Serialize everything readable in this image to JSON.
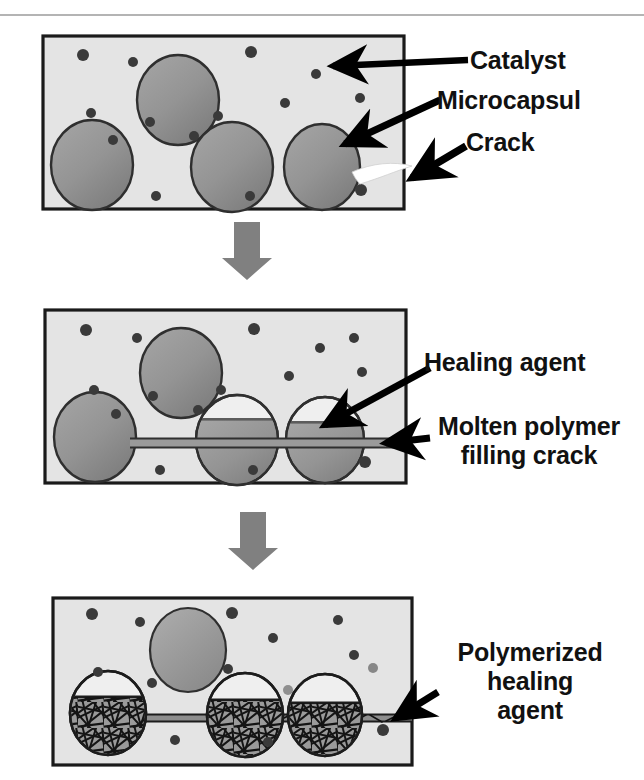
{
  "figure": {
    "colors": {
      "matrix_fill": "#e4e4e4",
      "matrix_border": "#1a1a1a",
      "capsule_fill": "#8f8f8f",
      "capsule_fill_light": "#9c9c9c",
      "capsule_border": "#2a2a2a",
      "catalyst_particle": "#3a3a3a",
      "arrow_gray": "#808080",
      "crack_white": "#ffffff",
      "label_text": "#111111",
      "pointer_black": "#000000",
      "rule_gray": "#b4b4b4",
      "polymer_network": "#161616"
    },
    "stage_arrows": [
      {
        "name": "stage-arrow-1-to-2",
        "x": 228,
        "y": 222,
        "width": 38,
        "height": 58
      },
      {
        "name": "stage-arrow-2-to-3",
        "x": 234,
        "y": 512,
        "width": 38,
        "height": 58
      }
    ]
  },
  "panels": [
    {
      "id": "panel-1",
      "stage_number": 1,
      "stage_name": "crack-formation",
      "frame": {
        "x": 43,
        "y": 36,
        "width": 361,
        "height": 173
      },
      "capsules": [
        {
          "cx": 178,
          "cy": 100,
          "rx": 41,
          "ry": 45
        },
        {
          "cx": 92,
          "cy": 165,
          "rx": 41,
          "ry": 45
        },
        {
          "cx": 232,
          "cy": 167,
          "rx": 41,
          "ry": 45
        },
        {
          "cx": 322,
          "cy": 167,
          "rx": 38,
          "ry": 43
        }
      ],
      "catalyst_particles": [
        {
          "cx": 83,
          "cy": 55,
          "r": 6
        },
        {
          "cx": 133,
          "cy": 62,
          "r": 5
        },
        {
          "cx": 251,
          "cy": 52,
          "r": 6
        },
        {
          "cx": 316,
          "cy": 74,
          "r": 5
        },
        {
          "cx": 351,
          "cy": 64,
          "r": 5
        },
        {
          "cx": 285,
          "cy": 103,
          "r": 5
        },
        {
          "cx": 360,
          "cy": 98,
          "r": 5
        },
        {
          "cx": 91,
          "cy": 113,
          "r": 5
        },
        {
          "cx": 150,
          "cy": 122,
          "r": 5
        },
        {
          "cx": 218,
          "cy": 116,
          "r": 5
        },
        {
          "cx": 194,
          "cy": 136,
          "r": 5
        },
        {
          "cx": 113,
          "cy": 140,
          "r": 5
        },
        {
          "cx": 156,
          "cy": 196,
          "r": 5
        },
        {
          "cx": 250,
          "cy": 196,
          "r": 5
        },
        {
          "cx": 361,
          "cy": 190,
          "r": 6
        }
      ],
      "labels": [
        {
          "name": "label-catalyst",
          "text": "Catalyst",
          "x": 470,
          "y": 46,
          "lines": [
            "Catalyst"
          ]
        },
        {
          "name": "label-microcapsul",
          "text": "Microcapsul",
          "x": 437,
          "y": 86,
          "lines": [
            "Microcapsul"
          ]
        },
        {
          "name": "label-crack",
          "text": "Crack",
          "x": 466,
          "y": 128,
          "lines": [
            "Crack"
          ]
        }
      ]
    },
    {
      "id": "panel-2",
      "stage_number": 2,
      "stage_name": "healing-agent-released",
      "frame": {
        "x": 45,
        "y": 310,
        "width": 361,
        "height": 173
      },
      "capsules": [
        {
          "cx": 181,
          "cy": 373,
          "rx": 41,
          "ry": 45,
          "drained": false
        },
        {
          "cx": 95,
          "cy": 437,
          "rx": 41,
          "ry": 45,
          "drained": false
        },
        {
          "cx": 237,
          "cy": 440,
          "rx": 41,
          "ry": 45,
          "drained": true,
          "fluid_level_y": 420
        },
        {
          "cx": 325,
          "cy": 440,
          "rx": 39,
          "ry": 43,
          "drained": true,
          "fluid_level_y": 423
        }
      ],
      "crack_channel": {
        "x1": 136,
        "y1": 443,
        "x2": 406,
        "y2": 443,
        "thickness": 9
      },
      "catalyst_particles": [
        {
          "cx": 86,
          "cy": 330,
          "r": 6
        },
        {
          "cx": 137,
          "cy": 338,
          "r": 5
        },
        {
          "cx": 254,
          "cy": 329,
          "r": 6
        },
        {
          "cx": 320,
          "cy": 348,
          "r": 5
        },
        {
          "cx": 354,
          "cy": 338,
          "r": 5
        },
        {
          "cx": 289,
          "cy": 376,
          "r": 5
        },
        {
          "cx": 362,
          "cy": 372,
          "r": 5
        },
        {
          "cx": 94,
          "cy": 390,
          "r": 5
        },
        {
          "cx": 153,
          "cy": 396,
          "r": 5
        },
        {
          "cx": 221,
          "cy": 390,
          "r": 5
        },
        {
          "cx": 198,
          "cy": 410,
          "r": 5
        },
        {
          "cx": 116,
          "cy": 414,
          "r": 5
        },
        {
          "cx": 160,
          "cy": 470,
          "r": 5
        },
        {
          "cx": 253,
          "cy": 470,
          "r": 5
        },
        {
          "cx": 365,
          "cy": 462,
          "r": 6
        }
      ],
      "labels": [
        {
          "name": "label-healing-agent",
          "text": "Healing agent",
          "x": 424,
          "y": 348,
          "lines": [
            "Healing agent"
          ]
        },
        {
          "name": "label-molten-polymer",
          "text": "Molten polymer filling crack",
          "x": 420,
          "y": 412,
          "lines": [
            "Molten polymer",
            "filling crack"
          ]
        }
      ]
    },
    {
      "id": "panel-3",
      "stage_number": 3,
      "stage_name": "polymerized-healed",
      "frame": {
        "x": 53,
        "y": 598,
        "width": 359,
        "height": 167
      },
      "capsules": [
        {
          "cx": 188,
          "cy": 650,
          "rx": 38,
          "ry": 42,
          "polymerized": false
        },
        {
          "cx": 108,
          "cy": 713,
          "rx": 38,
          "ry": 42,
          "polymerized": true,
          "fluid_level_y": 697
        },
        {
          "cx": 245,
          "cy": 715,
          "rx": 38,
          "ry": 42,
          "polymerized": true,
          "fluid_level_y": 700
        },
        {
          "cx": 325,
          "cy": 715,
          "rx": 37,
          "ry": 41,
          "polymerized": true,
          "fluid_level_y": 703
        }
      ],
      "crack_channel": {
        "x1": 145,
        "y1": 718,
        "x2": 412,
        "y2": 718,
        "thickness": 7
      },
      "catalyst_particles": [
        {
          "cx": 92,
          "cy": 614,
          "r": 6
        },
        {
          "cx": 140,
          "cy": 622,
          "r": 5
        },
        {
          "cx": 232,
          "cy": 613,
          "r": 6
        },
        {
          "cx": 273,
          "cy": 638,
          "r": 5
        },
        {
          "cx": 338,
          "cy": 620,
          "r": 5
        },
        {
          "cx": 354,
          "cy": 655,
          "r": 5
        },
        {
          "cx": 373,
          "cy": 668,
          "r": 5
        },
        {
          "cx": 98,
          "cy": 672,
          "r": 5
        },
        {
          "cx": 288,
          "cy": 690,
          "r": 5
        },
        {
          "cx": 152,
          "cy": 683,
          "r": 5
        },
        {
          "cx": 228,
          "cy": 669,
          "r": 5
        },
        {
          "cx": 175,
          "cy": 740,
          "r": 5
        },
        {
          "cx": 268,
          "cy": 742,
          "r": 5
        },
        {
          "cx": 383,
          "cy": 730,
          "r": 6
        }
      ],
      "labels": [
        {
          "name": "label-polymerized-healing-agent",
          "text": "Polymerized healing agent",
          "x": 432,
          "y": 638,
          "lines": [
            "Polymerized",
            "healing",
            "agent"
          ]
        }
      ]
    }
  ],
  "pointers": [
    {
      "name": "pointer-catalyst",
      "from": {
        "x": 470,
        "y": 58
      },
      "to": {
        "x": 322,
        "y": 67
      },
      "panel": "panel-1"
    },
    {
      "name": "pointer-microcapsul",
      "from": {
        "x": 437,
        "y": 106
      },
      "to": {
        "x": 333,
        "y": 143
      },
      "panel": "panel-1"
    },
    {
      "name": "pointer-crack",
      "from": {
        "x": 466,
        "y": 148
      },
      "to": {
        "x": 406,
        "y": 176
      },
      "panel": "panel-1"
    },
    {
      "name": "pointer-healing-agent",
      "from": {
        "x": 424,
        "y": 365
      },
      "to": {
        "x": 316,
        "y": 424
      },
      "panel": "panel-2"
    },
    {
      "name": "pointer-molten-polymer",
      "from": {
        "x": 424,
        "y": 437
      },
      "to": {
        "x": 378,
        "y": 443
      },
      "panel": "panel-2"
    },
    {
      "name": "pointer-polymerized",
      "from": {
        "x": 436,
        "y": 690
      },
      "to": {
        "x": 388,
        "y": 718
      },
      "panel": "panel-3"
    }
  ]
}
